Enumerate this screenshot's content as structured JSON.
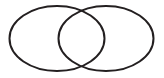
{
  "figure": {
    "background_color": "#ffffff",
    "width": 164,
    "height": 78
  },
  "chart_data": {
    "type": "diagram",
    "diagram_kind": "venn-two-set",
    "title": "",
    "labels": [],
    "stroke_color": "#231f20",
    "fill_color": "none",
    "stroke_width": 2,
    "shapes": [
      {
        "name": "left-ellipse",
        "type": "ellipse",
        "cx": 57,
        "cy": 38.5,
        "rx": 47.5,
        "ry": 32.5,
        "label": ""
      },
      {
        "name": "right-ellipse",
        "type": "ellipse",
        "cx": 106,
        "cy": 38.5,
        "rx": 47.5,
        "ry": 32.5,
        "label": ""
      }
    ],
    "intersection_points": [
      {
        "x": 81.5,
        "y": 6.8
      },
      {
        "x": 81.5,
        "y": 70.2
      }
    ],
    "xlim": [
      0,
      164
    ],
    "ylim": [
      0,
      78
    ]
  }
}
